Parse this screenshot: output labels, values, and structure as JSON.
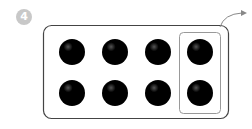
{
  "badge": {
    "number": "4",
    "color": "#c8c8c8"
  },
  "frame": {
    "rows": 2,
    "columns": 4,
    "counters": 8
  },
  "highlight": {
    "column": 4,
    "counters": 2,
    "arrow": "curved-arrow-right"
  },
  "colors": {
    "counter": "#000000",
    "frame_stroke": "#444444",
    "highlight_stroke": "#999999"
  }
}
